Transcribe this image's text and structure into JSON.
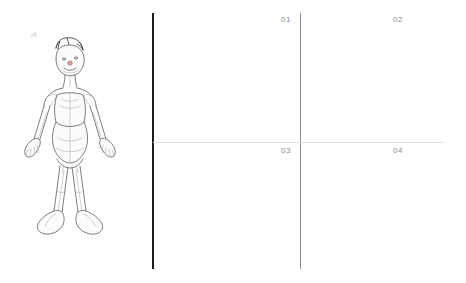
{
  "page": {
    "background_color": "#ffffff",
    "width": 466,
    "height": 283
  },
  "sketch": {
    "name": "humanoid-figure-pencil-sketch",
    "description": "",
    "stroke_color": "#6e6e74",
    "light_stroke_color": "#b9b9bf",
    "fill_color": "#fbfbfc",
    "nose_color": "#c98b84"
  },
  "grid": {
    "thick_divider_color": "#1d1d1d",
    "thin_divider_color": "#8d8d8d",
    "horizontal_line_color": "#e2e0e0",
    "label_color": "#8a8a8a",
    "quadrants": [
      {
        "id": "01",
        "label": "01"
      },
      {
        "id": "02",
        "label": "02"
      },
      {
        "id": "03",
        "label": "03"
      },
      {
        "id": "04",
        "label": "04"
      }
    ]
  }
}
